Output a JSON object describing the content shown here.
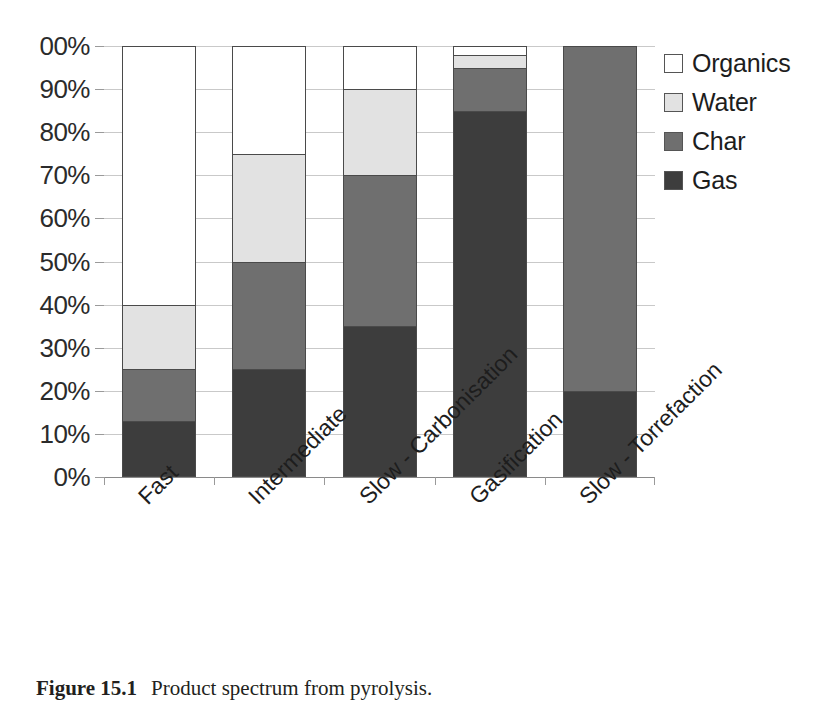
{
  "chart_data": {
    "type": "bar",
    "subtype": "stacked-percent",
    "title": "",
    "xlabel": "",
    "ylabel": "",
    "ylim": [
      0,
      100
    ],
    "grid": true,
    "legend_position": "right",
    "categories": [
      "Fast",
      "Intermediate",
      "Slow - Carbonisation",
      "Gasification",
      "Slow - Torrefaction"
    ],
    "ytick_labels": [
      "00%",
      "90%",
      "80%",
      "70%",
      "60%",
      "50%",
      "40%",
      "30%",
      "20%",
      "10%",
      "0%"
    ],
    "ytick_values": [
      100,
      90,
      80,
      70,
      60,
      50,
      40,
      30,
      20,
      10,
      0
    ],
    "series": [
      {
        "name": "Gas",
        "color": "#3d3d3d",
        "values": [
          13,
          25,
          35,
          85,
          20
        ]
      },
      {
        "name": "Char",
        "color": "#6f6f6f",
        "values": [
          12,
          25,
          35,
          10,
          80
        ]
      },
      {
        "name": "Water",
        "color": "#e2e2e2",
        "values": [
          15,
          25,
          20,
          3,
          0
        ]
      },
      {
        "name": "Organics",
        "color": "#ffffff",
        "values": [
          60,
          25,
          10,
          2,
          0
        ]
      }
    ],
    "stack_tops": {
      "Gas": [
        13,
        25,
        35,
        85,
        20
      ],
      "Char": [
        25,
        50,
        70,
        95,
        100
      ],
      "Water": [
        40,
        75,
        90,
        98,
        100
      ],
      "Organics": [
        100,
        100,
        100,
        100,
        100
      ]
    }
  },
  "legend": {
    "items": [
      {
        "label": "Organics",
        "color": "#ffffff"
      },
      {
        "label": "Water",
        "color": "#e2e2e2"
      },
      {
        "label": "Char",
        "color": "#6f6f6f"
      },
      {
        "label": "Gas",
        "color": "#3d3d3d"
      }
    ]
  },
  "caption": {
    "number": "Figure 15.1",
    "text": "Product spectrum from pyrolysis."
  }
}
